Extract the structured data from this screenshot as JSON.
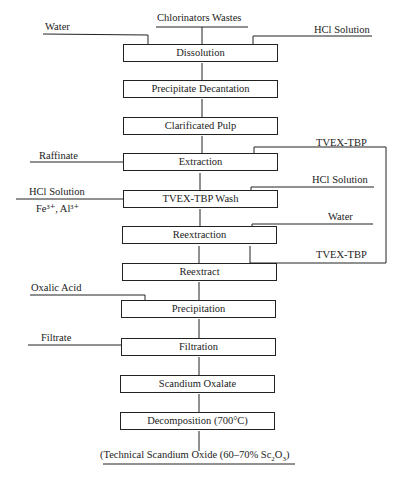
{
  "diagram": {
    "type": "process-flowchart",
    "input": "Chlorinators Wastes",
    "steps": [
      {
        "id": "dissolution",
        "label": "Dissolution"
      },
      {
        "id": "precipitate-decantation",
        "label": "Precipitate Decantation"
      },
      {
        "id": "clarificated-pulp",
        "label": "Clarificated Pulp"
      },
      {
        "id": "extraction",
        "label": "Extraction"
      },
      {
        "id": "tvex-tbp-wash",
        "label": "TVEX-TBP Wash"
      },
      {
        "id": "reextraction",
        "label": "Reextraction"
      },
      {
        "id": "reextract",
        "label": "Reextract"
      },
      {
        "id": "precipitation",
        "label": "Precipitation"
      },
      {
        "id": "filtration",
        "label": "Filtration"
      },
      {
        "id": "scandium-oxalate",
        "label": "Scandium Oxalate"
      },
      {
        "id": "decomposition",
        "label": "Decomposition (700°C)"
      }
    ],
    "side_streams": {
      "water_in_dissolution": "Water",
      "hcl_in_dissolution": "HCl Solution",
      "raffinate_out": "Raffinate",
      "tvex_tbp_in_extraction": "TVEX-TBP",
      "wash_out_label": "HCl Solution",
      "wash_out_ions": "Fe³⁺, Al³⁺",
      "hcl_in_wash": "HCl Solution",
      "water_in_reextraction": "Water",
      "tvex_tbp_recycle": "TVEX-TBP",
      "oxalic_acid_in": "Oxalic Acid",
      "filtrate_out": "Filtrate"
    },
    "output": {
      "prefix": "(Technical Scandium Oxide (60–70% Sc",
      "sub1": "2",
      "mid": "O",
      "sub2": "3",
      "suffix": ")"
    }
  }
}
